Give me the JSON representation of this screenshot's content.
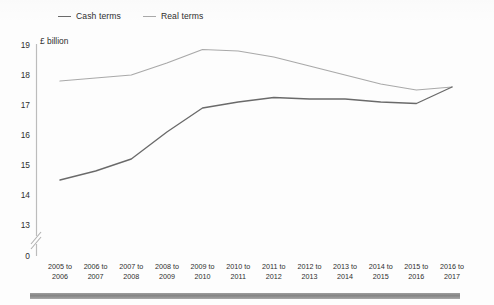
{
  "chart_data": {
    "type": "line",
    "title": "",
    "subtitle": "",
    "xlabel": "",
    "ylabel": "£ billion",
    "unit_caption": "£ billion",
    "ylim": [
      13,
      19
    ],
    "yticks": [
      19,
      18,
      17,
      16,
      15,
      14,
      13
    ],
    "zero_tick": "0",
    "axis_break": true,
    "grid": false,
    "legend_position": "top-left",
    "categories": [
      "2005 to 2006",
      "2006 to 2007",
      "2007 to 2008",
      "2008 to 2009",
      "2009 to 2010",
      "2010 to 2011",
      "2011 to 2012",
      "2012 to 2013",
      "2013 to 2014",
      "2014 to 2015",
      "2015 to 2016",
      "2016 to 2017"
    ],
    "categories_lines": [
      [
        "2005 to",
        "2006"
      ],
      [
        "2006 to",
        "2007"
      ],
      [
        "2007 to",
        "2008"
      ],
      [
        "2008 to",
        "2009"
      ],
      [
        "2009 to",
        "2010"
      ],
      [
        "2010 to",
        "2011"
      ],
      [
        "2011 to",
        "2012"
      ],
      [
        "2012 to",
        "2013"
      ],
      [
        "2013 to",
        "2014"
      ],
      [
        "2014 to",
        "2015"
      ],
      [
        "2015 to",
        "2016"
      ],
      [
        "2016 to",
        "2017"
      ]
    ],
    "series": [
      {
        "name": "Cash terms",
        "color": "#6a6a6a",
        "values": [
          14.5,
          14.8,
          15.2,
          16.1,
          16.9,
          17.1,
          17.25,
          17.2,
          17.2,
          17.1,
          17.05,
          17.6
        ]
      },
      {
        "name": "Real terms",
        "color": "#a9a9a9",
        "values": [
          17.8,
          17.9,
          18.0,
          18.4,
          18.85,
          18.8,
          18.6,
          18.3,
          18.0,
          17.7,
          17.5,
          17.6
        ]
      }
    ]
  },
  "legend": {
    "items": [
      {
        "label": "Cash terms",
        "color": "#6a6a6a"
      },
      {
        "label": "Real terms",
        "color": "#a9a9a9"
      }
    ]
  },
  "axis": {
    "unit_caption": "£ billion",
    "y_labels": [
      "19",
      "18",
      "17",
      "16",
      "15",
      "14",
      "13",
      "0"
    ]
  },
  "colors": {
    "cash_terms": "#6a6a6a",
    "real_terms": "#a9a9a9",
    "axis": "#b5b5b5",
    "text": "#2e2e2e",
    "background": "#fdfdfd"
  }
}
